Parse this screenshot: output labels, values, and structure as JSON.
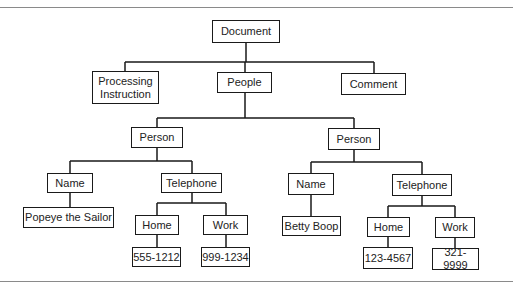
{
  "diagram": {
    "type": "tree",
    "root": {
      "label": "Document",
      "children": [
        {
          "label": "Processing\nInstruction"
        },
        {
          "label": "People",
          "children": [
            {
              "label": "Person",
              "children": [
                {
                  "label": "Name",
                  "children": [
                    {
                      "label": "Popeye the Sailor"
                    }
                  ]
                },
                {
                  "label": "Telephone",
                  "children": [
                    {
                      "label": "Home",
                      "children": [
                        {
                          "label": "555-1212"
                        }
                      ]
                    },
                    {
                      "label": "Work",
                      "children": [
                        {
                          "label": "999-1234"
                        }
                      ]
                    }
                  ]
                }
              ]
            },
            {
              "label": "Person",
              "children": [
                {
                  "label": "Name",
                  "children": [
                    {
                      "label": "Betty Boop"
                    }
                  ]
                },
                {
                  "label": "Telephone",
                  "children": [
                    {
                      "label": "Home",
                      "children": [
                        {
                          "label": "123-4567"
                        }
                      ]
                    },
                    {
                      "label": "Work",
                      "children": [
                        {
                          "label": "321-9999"
                        }
                      ]
                    }
                  ]
                }
              ]
            }
          ]
        },
        {
          "label": "Comment"
        }
      ]
    }
  },
  "nodes": {
    "document": "Document",
    "processing_instruction": "Processing\nInstruction",
    "people": "People",
    "comment": "Comment",
    "person_1": "Person",
    "person_2": "Person",
    "name_1": "Name",
    "telephone_1": "Telephone",
    "name_2": "Name",
    "telephone_2": "Telephone",
    "value_name_1": "Popeye the Sailor",
    "home_1": "Home",
    "work_1": "Work",
    "value_name_2": "Betty Boop",
    "home_2": "Home",
    "work_2": "Work",
    "value_home_1": "555-1212",
    "value_work_1": "999-1234",
    "value_home_2": "123-4567",
    "value_work_2": "321-9999"
  },
  "colors": {
    "line": "#1a1a1a",
    "rule": "#8a8a8a",
    "background": "#ffffff"
  }
}
